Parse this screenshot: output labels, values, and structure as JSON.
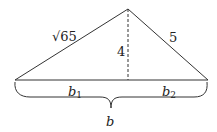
{
  "diagram": {
    "type": "triangle-with-altitude",
    "labels": {
      "left_side": "√65",
      "right_side": "5",
      "altitude": "4",
      "base_left_var": "b",
      "base_left_sub": "1",
      "base_right_var": "b",
      "base_right_sub": "2",
      "base_total": "b"
    },
    "colors": {
      "stroke": "#333333",
      "text": "#222222",
      "background": "#ffffff"
    }
  }
}
